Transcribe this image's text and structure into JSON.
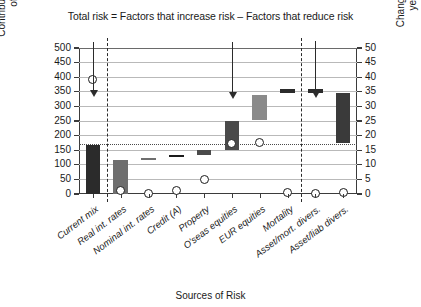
{
  "chart_data": {
    "type": "bar",
    "title": "Total risk = Factors that increase risk – Factors that reduce risk",
    "xlabel": "Sources of Risk",
    "ylabel": "Contribution to volatility of surplus",
    "ylabel_right": "Change in expected end year surplus(£m)",
    "ylim": [
      0,
      500
    ],
    "ylim_right": [
      0,
      50
    ],
    "yticks": [
      0,
      50,
      100,
      150,
      200,
      250,
      300,
      350,
      400,
      450,
      500
    ],
    "yticks_right": [
      0,
      5,
      10,
      15,
      20,
      25,
      30,
      35,
      40,
      45,
      50
    ],
    "grid": true,
    "legend": "none",
    "categories": [
      "Current mix",
      "Real int. rates",
      "Nominal int. rates",
      "Credit (A)",
      "Property",
      "O'seas equities",
      "EUR equities",
      "Mortality",
      "Asset/mort. divers.",
      "Asset/liab divers."
    ],
    "bars": [
      {
        "category": "Current mix",
        "bottom": 0,
        "top": 168,
        "color": "#2b2b2b"
      },
      {
        "category": "Real int. rates",
        "bottom": 0,
        "top": 117,
        "color": "#6e6e6e"
      },
      {
        "category": "Nominal int. rates",
        "bottom": 118,
        "top": 125,
        "color": "#6e6e6e"
      },
      {
        "category": "Credit (A)",
        "bottom": 128,
        "top": 132,
        "color": "#1b1b1b"
      },
      {
        "category": "Property",
        "bottom": 133,
        "top": 150,
        "color": "#4a4a4a"
      },
      {
        "category": "O'seas equities",
        "bottom": 152,
        "top": 250,
        "color": "#4a4a4a"
      },
      {
        "category": "EUR equities",
        "bottom": 252,
        "top": 340,
        "color": "#8a8a8a"
      },
      {
        "category": "Mortality",
        "bottom": 345,
        "top": 358,
        "color": "#2b2b2b"
      },
      {
        "category": "Asset/mort. divers.",
        "bottom": 345,
        "top": 358,
        "color": "#2b2b2b"
      },
      {
        "category": "Asset/liab divers.",
        "bottom": 175,
        "top": 345,
        "color": "#3a3a3a"
      }
    ],
    "markers": [
      {
        "category": "Current mix",
        "value": 392
      },
      {
        "category": "Real int. rates",
        "value": 12
      },
      {
        "category": "Nominal int. rates",
        "value": 3
      },
      {
        "category": "Credit (A)",
        "value": 11
      },
      {
        "category": "Property",
        "value": 50
      },
      {
        "category": "O'seas equities",
        "value": 172
      },
      {
        "category": "EUR equities",
        "value": 175
      },
      {
        "category": "Mortality",
        "value": 5
      },
      {
        "category": "Asset/mort. divers.",
        "value": 1
      },
      {
        "category": "Asset/liab divers.",
        "value": 4
      }
    ],
    "reference_line": {
      "value": 170,
      "style": "dotted"
    },
    "separators": [
      {
        "after_category": "Current mix"
      },
      {
        "after_category": "Mortality"
      }
    ],
    "arrows": [
      {
        "x_category": "Current mix",
        "from": 520,
        "to": 355
      },
      {
        "x_category": "O'seas equities",
        "from": 520,
        "to": 350
      },
      {
        "x_category": "Asset/mort. divers.",
        "from": 525,
        "to": 352
      }
    ]
  }
}
